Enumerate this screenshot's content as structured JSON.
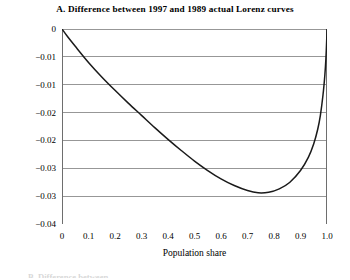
{
  "figure": {
    "panel_label": "A.",
    "title": "A. Difference between 1997 and 1989 actual Lorenz curves",
    "next_caption_fragment": "B. Difference between"
  },
  "axes": {
    "x_title": "Population share",
    "y_title": "",
    "x_tick_labels": [
      "0",
      "0.1",
      "0.2",
      "0.3",
      "0.4",
      "0.5",
      "0.6",
      "0.7",
      "0.8",
      "0.9",
      "1.0"
    ],
    "y_tick_labels": [
      "0",
      "−0.01",
      "−0.01",
      "−0.02",
      "−0.02",
      "−0.03",
      "−0.03",
      "−0.04"
    ]
  },
  "style": {
    "curve_color": "#1a1a1a",
    "grid_color": "#8c8c8c",
    "axis_color": "#6e6e6e",
    "background": "#ffffff"
  },
  "chart_data": {
    "type": "line",
    "title": "A. Difference between 1997 and 1989 actual Lorenz curves",
    "xlabel": "Population share",
    "ylabel": "",
    "xlim": [
      0,
      1.0
    ],
    "ylim": [
      -0.035,
      0
    ],
    "grid": true,
    "legend": "none",
    "x_ticks": [
      0,
      0.1,
      0.2,
      0.3,
      0.4,
      0.5,
      0.6,
      0.7,
      0.8,
      0.9,
      1.0
    ],
    "y_ticks": [
      0,
      -0.005,
      -0.01,
      -0.015,
      -0.02,
      -0.025,
      -0.03,
      -0.035
    ],
    "y_tick_display": [
      "0",
      "−0.01",
      "−0.01",
      "−0.02",
      "−0.02",
      "−0.03",
      "−0.03",
      "−0.04"
    ],
    "series": [
      {
        "name": "Difference between 1997 and 1989 actual Lorenz curves",
        "x": [
          0.0,
          0.02,
          0.05,
          0.1,
          0.15,
          0.2,
          0.25,
          0.3,
          0.35,
          0.4,
          0.45,
          0.5,
          0.55,
          0.6,
          0.65,
          0.7,
          0.74,
          0.78,
          0.82,
          0.86,
          0.9,
          0.93,
          0.95,
          0.965,
          0.975,
          0.985,
          0.992,
          0.996,
          0.999,
          1.0
        ],
        "y": [
          0.0,
          -0.0013,
          -0.0031,
          -0.006,
          -0.0086,
          -0.011,
          -0.0133,
          -0.0155,
          -0.0177,
          -0.0198,
          -0.0218,
          -0.0237,
          -0.0254,
          -0.0269,
          -0.0281,
          -0.029,
          -0.0294,
          -0.0293,
          -0.0287,
          -0.0275,
          -0.0254,
          -0.023,
          -0.0206,
          -0.018,
          -0.0155,
          -0.0118,
          -0.0082,
          -0.0052,
          -0.0018,
          0.0
        ]
      }
    ],
    "annotations": {
      "minimum_x": 0.74,
      "minimum_y": -0.0294,
      "endpoint_start": [
        0,
        0
      ],
      "endpoint_end": [
        1.0,
        0
      ]
    }
  }
}
